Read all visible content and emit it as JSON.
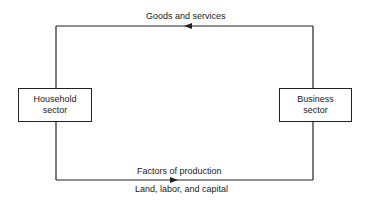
{
  "diagram": {
    "top_flow": {
      "label": "Goods and services",
      "direction": "business-to-household"
    },
    "bottom_flow": {
      "label": "Factors of production",
      "sublabel": "Land, labor, and capital",
      "direction": "household-to-business"
    },
    "nodes": {
      "household": {
        "line1": "Household",
        "line2": "sector"
      },
      "business": {
        "line1": "Business",
        "line2": "sector"
      }
    },
    "colors": {
      "line": "#222222",
      "background": "#ffffff"
    }
  }
}
